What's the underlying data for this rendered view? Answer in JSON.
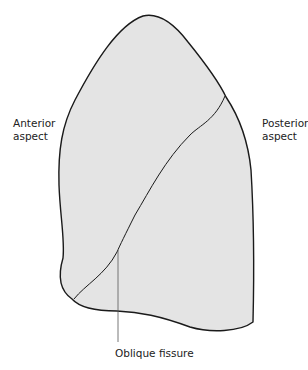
{
  "diagram": {
    "labels": {
      "anterior": [
        "Anterior",
        "aspect"
      ],
      "posterior": [
        "Posterior",
        "aspect"
      ],
      "fissure": "Oblique fissure"
    },
    "colors": {
      "lung_fill": "#e4e4e4",
      "outline": "#1a1a1a",
      "background": "#ffffff"
    }
  }
}
